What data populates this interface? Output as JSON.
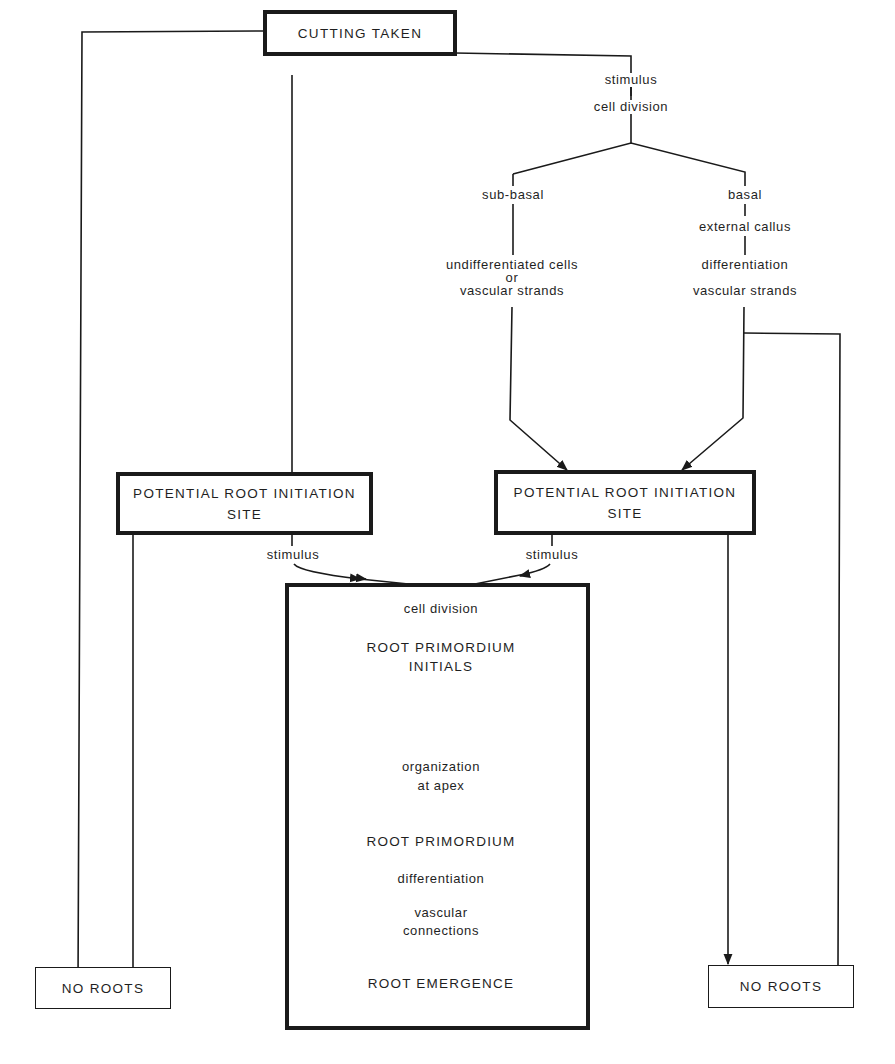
{
  "diagram": {
    "type": "flowchart",
    "topic": "Adventitious root formation in cuttings",
    "nodes": {
      "cutting_taken": "CUTTING TAKEN",
      "stimulus_top": "stimulus",
      "cell_division_top": "cell division",
      "sub_basal": "sub-basal",
      "basal": "basal",
      "undiff_line1": "undifferentiated cells",
      "undiff_line2": "or",
      "undiff_line3": "vascular strands",
      "external_callus": "external callus",
      "differentiation_right": "differentiation",
      "vascular_strands_right": "vascular strands",
      "prist_left_line1": "POTENTIAL ROOT INITIATION",
      "prist_left_line2": "SITE",
      "prist_right_line1": "POTENTIAL ROOT INITIATION",
      "prist_right_line2": "SITE",
      "stimulus_left": "stimulus",
      "stimulus_right": "stimulus",
      "no_roots_left": "NO ROOTS",
      "no_roots_right": "NO ROOTS"
    },
    "sequence_box": {
      "steps": [
        "cell division",
        "ROOT PRIMORDIUM",
        "INITIALS",
        "organization",
        "at apex",
        "ROOT PRIMORDIUM",
        "differentiation",
        "vascular",
        "connections",
        "ROOT EMERGENCE"
      ]
    },
    "colors": {
      "line": "#1a1a1a",
      "background": "#ffffff"
    }
  }
}
